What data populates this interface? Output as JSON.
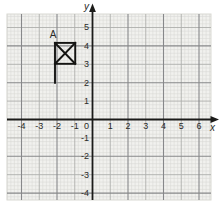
{
  "figure": {
    "background": "#ffffff",
    "paper_color": "#f1f1ee",
    "paper_edge_color": "#d9d9d4",
    "grid_colors": {
      "minor": "#d8d8d4",
      "unit": "#aeafab",
      "major": "#87888a"
    },
    "axis_color": "#1b1b19",
    "text_color": "#2a2a28",
    "marker_color": "#141412"
  },
  "chart_data": {
    "type": "scatter",
    "title": "",
    "subtitle": "",
    "xlabel": "x",
    "ylabel": "y",
    "xlim": [
      -4.8,
      6.7
    ],
    "ylim": [
      -4.4,
      5.7
    ],
    "grid": {
      "style": "graph-paper",
      "minor_step": 0.2,
      "unit_step": 1,
      "major_step": 2,
      "grid_on": true
    },
    "origin_label": "0",
    "x_ticks": [
      {
        "value": -4,
        "label": "-4"
      },
      {
        "value": -3,
        "label": "-3"
      },
      {
        "value": -2,
        "label": "-2"
      },
      {
        "value": -1,
        "label": "-1"
      },
      {
        "value": 1,
        "label": "1"
      },
      {
        "value": 2,
        "label": "2"
      },
      {
        "value": 3,
        "label": "3"
      },
      {
        "value": 4,
        "label": "4"
      },
      {
        "value": 5,
        "label": "5"
      },
      {
        "value": 6,
        "label": "6"
      }
    ],
    "y_ticks": [
      {
        "value": 5,
        "label": "5"
      },
      {
        "value": 4,
        "label": "4"
      },
      {
        "value": 3,
        "label": "3"
      },
      {
        "value": 2,
        "label": "2"
      },
      {
        "value": 1,
        "label": "1"
      },
      {
        "value": -1,
        "label": "-1"
      },
      {
        "value": -2,
        "label": "-2"
      },
      {
        "value": -3,
        "label": "-3"
      },
      {
        "value": -4,
        "label": "-4"
      }
    ],
    "points": [
      {
        "label": "A",
        "marker": "crossed-square",
        "square": {
          "x_min": -2,
          "x_max": -1,
          "y_min": 3,
          "y_max": 4
        },
        "stem": {
          "x": -2,
          "y_from": 3,
          "y_to": 2
        },
        "label_position": {
          "x": -2.5,
          "y": 4.6
        }
      }
    ]
  }
}
